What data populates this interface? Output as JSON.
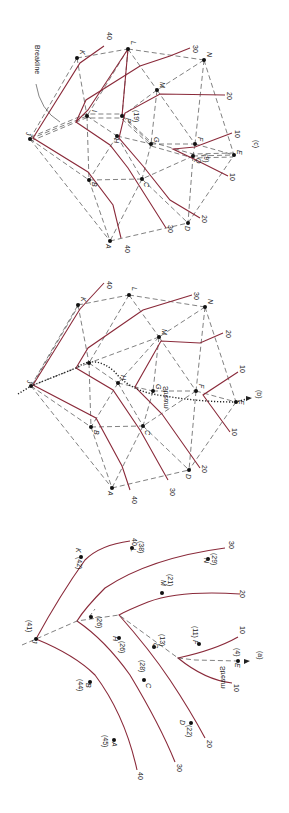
{
  "figure": {
    "orientation": "rotated 90 degrees clockwise",
    "colors": {
      "contour": "#8a2a3a",
      "tin_edge": "#4a4a4a",
      "point": "#111111"
    },
    "panels": [
      {
        "id": "a",
        "caption": "(a)",
        "stream_label": "Stream",
        "points": [
          {
            "name": "J",
            "elev": "(41)"
          },
          {
            "name": "K",
            "elev": "(42)"
          },
          {
            "name": "L",
            "elev": "(38)"
          },
          {
            "name": "N",
            "elev": "(29)"
          },
          {
            "name": "M",
            "elev": "(21)"
          },
          {
            "name": "I",
            "elev": "(26)"
          },
          {
            "name": "H",
            "elev": "(26)"
          },
          {
            "name": "G",
            "elev": "(13)"
          },
          {
            "name": "F",
            "elev": "(11)"
          },
          {
            "name": "E",
            "elev": "(4)"
          },
          {
            "name": "C",
            "elev": "(28)"
          },
          {
            "name": "B",
            "elev": "(44)"
          },
          {
            "name": "D",
            "elev": "(22)"
          },
          {
            "name": "A",
            "elev": "(45)"
          }
        ],
        "contour_labels": [
          "40",
          "30",
          "20",
          "10",
          "10",
          "20",
          "30",
          "40"
        ]
      },
      {
        "id": "b",
        "caption": "(b)",
        "stream_label": "Stream",
        "points": [
          "J",
          "K",
          "L",
          "N",
          "M",
          "I",
          "H",
          "G",
          "F",
          "E",
          "C",
          "B",
          "D",
          "A"
        ],
        "contour_labels": [
          "40",
          "30",
          "20",
          "10",
          "10",
          "20",
          "30",
          "40"
        ]
      },
      {
        "id": "c",
        "caption": "(c)",
        "breakline_label": "Breakline",
        "points": [
          "J",
          "K",
          "L",
          "N",
          "M",
          "I",
          "P",
          "H",
          "G",
          "F",
          "Q",
          "E",
          "C",
          "B",
          "D",
          "A"
        ],
        "extra_elevations": {
          "P": "(19)",
          "Q": "(9)"
        },
        "contour_labels": [
          "40",
          "30",
          "20",
          "10",
          "10",
          "20",
          "30",
          "40"
        ]
      }
    ]
  },
  "labels": {
    "A": "A",
    "B": "B",
    "C": "C",
    "D": "D",
    "E": "E",
    "F": "F",
    "G": "G",
    "H": "H",
    "I": "I",
    "J": "J",
    "K": "K",
    "L": "L",
    "M": "M",
    "N": "N",
    "P": "P",
    "Q": "Q",
    "e_A": "(45)",
    "e_B": "(44)",
    "e_C": "(28)",
    "e_D": "(22)",
    "e_E": "(4)",
    "e_F": "(11)",
    "e_G": "(13)",
    "e_H": "(26)",
    "e_I": "(26)",
    "e_J": "(41)",
    "e_K": "(42)",
    "e_L": "(38)",
    "e_M": "(21)",
    "e_N": "(29)",
    "e_P": "(19)",
    "e_Q": "(9)",
    "c10": "10",
    "c20": "20",
    "c30": "30",
    "c40": "40",
    "cap_a": "(a)",
    "cap_b": "(b)",
    "cap_c": "(c)",
    "stream": "Stream",
    "breakline": "Breakline"
  }
}
